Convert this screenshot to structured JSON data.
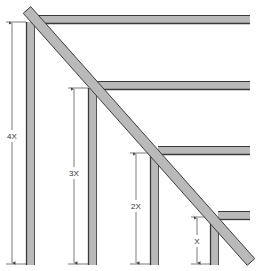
{
  "diagram": {
    "type": "stepped-frame-with-diagonal-brace",
    "colors": {
      "member_fill": "#b9b9b9",
      "member_edge": "#3a3a3a",
      "dimension_line": "#444444",
      "background": "#ffffff"
    },
    "posts": [
      {
        "id": "post-1",
        "x": 26,
        "top": 22,
        "bottom": 265,
        "width": 9
      },
      {
        "id": "post-2",
        "x": 88,
        "top": 88,
        "bottom": 265,
        "width": 9
      },
      {
        "id": "post-3",
        "x": 150,
        "top": 153,
        "bottom": 265,
        "width": 9
      },
      {
        "id": "post-4",
        "x": 210,
        "top": 217,
        "bottom": 265,
        "width": 9
      }
    ],
    "beams": [
      {
        "id": "beam-1",
        "y": 15,
        "left": 34,
        "right": 250,
        "height": 9
      },
      {
        "id": "beam-2",
        "y": 81,
        "left": 96,
        "right": 250,
        "height": 9
      },
      {
        "id": "beam-3",
        "y": 146,
        "left": 158,
        "right": 250,
        "height": 9
      },
      {
        "id": "beam-4",
        "y": 211,
        "left": 218,
        "right": 250,
        "height": 9
      }
    ],
    "brace": {
      "x1": 27,
      "y1": 10,
      "x2": 251,
      "y2": 262,
      "width": 10
    },
    "dimensions": [
      {
        "label": "4X",
        "x": 12,
        "top": 22,
        "bottom": 264,
        "label_y": 137
      },
      {
        "label": "3X",
        "x": 74,
        "top": 88,
        "bottom": 264,
        "label_y": 174
      },
      {
        "label": "2X",
        "x": 136,
        "top": 153,
        "bottom": 264,
        "label_y": 207
      },
      {
        "label": "X",
        "x": 197,
        "top": 217,
        "bottom": 264,
        "label_y": 242
      }
    ]
  }
}
